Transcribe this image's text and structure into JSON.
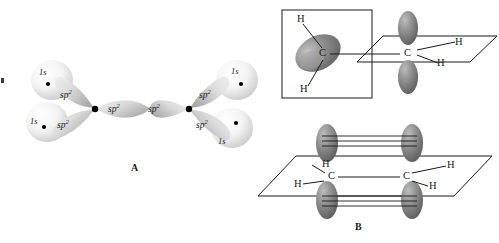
{
  "figure": {
    "type": "chemistry-orbital-diagram",
    "background": "#ffffff"
  },
  "colors": {
    "s_orbital_light": "#f2f2f2",
    "s_orbital_shade": "#cfcfcf",
    "sp2_light": "#e3e3e3",
    "sp2_shade": "#b0b0b0",
    "p_orbital": "#8a8a8a",
    "p_orbital_dark": "#6a6a6a",
    "p_orbital_highlight": "#b8b8b8",
    "line": "#1a1a1a",
    "nucleus": "#000000"
  },
  "panel_a": {
    "label": "A",
    "left_carbon": {
      "hydrogen_orbitals": [
        {
          "name": "1s",
          "position": "upper-left"
        },
        {
          "name": "1s",
          "position": "lower-left"
        }
      ],
      "hybrid_orbitals": [
        {
          "name": "sp",
          "exponent": "2",
          "position": "upper"
        },
        {
          "name": "sp",
          "exponent": "2",
          "position": "lower"
        },
        {
          "name": "sp",
          "exponent": "2",
          "position": "toward-right-carbon"
        }
      ]
    },
    "right_carbon": {
      "hydrogen_orbitals": [
        {
          "name": "1s",
          "position": "upper-right"
        },
        {
          "name": "1s",
          "position": "lower-right"
        }
      ],
      "hybrid_orbitals": [
        {
          "name": "sp",
          "exponent": "2",
          "position": "upper"
        },
        {
          "name": "sp",
          "exponent": "2",
          "position": "lower"
        },
        {
          "name": "sp",
          "exponent": "2",
          "position": "toward-left-carbon"
        }
      ]
    },
    "orbital_label_text": "sp",
    "orbital_exponent": "2",
    "s_label_text": "1s"
  },
  "panel_top_right": {
    "description": "Two sp2 carbons with perpendicular planes before rotation",
    "left_group": {
      "boxed": true,
      "carbon_label": "C",
      "hydrogen_labels": [
        "H",
        "H"
      ],
      "p_orbital_orientation": "in-plane-of-page-tilted"
    },
    "right_group": {
      "boxed": false,
      "carbon_label": "C",
      "hydrogen_labels": [
        "H",
        "H"
      ],
      "p_orbital_orientation": "perpendicular-vertical"
    }
  },
  "panel_b": {
    "label": "B",
    "description": "Planar ethene with parallel p orbitals overlapping to form a pi bond",
    "left_carbon_label": "C",
    "right_carbon_label": "C",
    "left_hydrogens": [
      "H",
      "H"
    ],
    "right_hydrogens": [
      "H",
      "H"
    ],
    "p_orbitals": [
      {
        "position": "top-left",
        "orientation": "vertical-up"
      },
      {
        "position": "top-right",
        "orientation": "vertical-up"
      },
      {
        "position": "bottom-left",
        "orientation": "vertical-down"
      },
      {
        "position": "bottom-right",
        "orientation": "vertical-down"
      }
    ],
    "pi_overlap_lines": {
      "top_count": 3,
      "bottom_count": 3
    }
  }
}
